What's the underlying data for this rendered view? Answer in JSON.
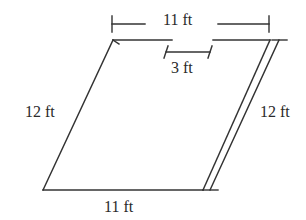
{
  "diagram": {
    "type": "parallelogram",
    "stroke_color": "#333333",
    "labels": {
      "top_base": "11 ft",
      "bottom_base": "11 ft",
      "left_side": "12 ft",
      "right_dimension": "12 ft",
      "offset": "3 ft"
    },
    "vertices": {
      "bottom_left": [
        43,
        190
      ],
      "bottom_right": [
        203,
        190
      ],
      "top_right": [
        270,
        40
      ],
      "top_left": [
        113,
        40
      ]
    }
  }
}
